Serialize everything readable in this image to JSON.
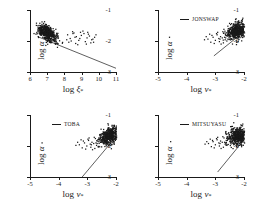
{
  "figure": {
    "width": 257,
    "height": 211,
    "background": "#ffffff",
    "ink": "#1a1a1a"
  },
  "chart_data": [
    {
      "type": "scatter",
      "panel": "top-left",
      "title": "",
      "legend_label": "",
      "legend_position": "none",
      "xlabel": "log ξ",
      "xlabel_sub": "*",
      "ylabel": "log α",
      "xlim": [
        6,
        11
      ],
      "ylim": [
        -3,
        -1
      ],
      "xticks": [
        6,
        7,
        8,
        9,
        10,
        11
      ],
      "xticklabels": [
        "6",
        "7",
        "8",
        "9",
        "10",
        "11"
      ],
      "yticks": [
        -1,
        -2,
        -3
      ],
      "yticklabels": [
        "-1",
        "-2",
        "-3"
      ],
      "grid": false,
      "marker": "dot",
      "line": {
        "x": [
          6.45,
          11.0
        ],
        "y": [
          -1.86,
          -2.88
        ]
      },
      "cluster": {
        "cx": 6.95,
        "cy": -1.72,
        "sx": 0.3,
        "sy": 0.115,
        "rotation_deg": -18,
        "n": 520
      },
      "sparse": {
        "x": [
          8.15,
          8.3,
          8.52,
          8.66,
          8.8,
          8.95,
          9.1,
          9.28,
          9.42,
          9.55,
          9.72,
          8.22,
          8.44,
          8.62,
          8.9,
          9.18,
          9.36,
          9.62,
          8.36,
          8.74,
          9.04,
          9.5,
          8.1,
          8.58,
          9.24,
          9.8,
          8.46,
          8.86,
          9.32,
          9.66
        ],
        "y": [
          -1.78,
          -1.9,
          -1.72,
          -1.84,
          -1.96,
          -1.8,
          -1.74,
          -1.88,
          -1.82,
          -1.94,
          -1.86,
          -2.02,
          -1.68,
          -2.06,
          -1.7,
          -2.0,
          -1.76,
          -1.92,
          -1.98,
          -2.1,
          -1.66,
          -2.04,
          -1.94,
          -1.86,
          -2.08,
          -1.78,
          -1.74,
          -1.9,
          -1.7,
          -2.02
        ]
      }
    },
    {
      "type": "scatter",
      "panel": "top-right",
      "title": "",
      "legend_label": "JONSWAP",
      "legend_position": "upper left",
      "xlabel": "log ν",
      "xlabel_sub": "*",
      "ylabel": "log α",
      "xlim": [
        -5,
        -2
      ],
      "ylim": [
        -3,
        -1
      ],
      "xticks": [
        -5,
        -4,
        -3,
        -2
      ],
      "xticklabels": [
        "-5",
        "-4",
        "-3",
        "-2"
      ],
      "yticks": [
        -1,
        -2,
        -3
      ],
      "yticklabels": [
        "-1",
        "-2",
        "-3"
      ],
      "grid": false,
      "marker": "dot",
      "line": {
        "x": [
          -3.05,
          -2.0
        ],
        "y": [
          -2.48,
          -1.7
        ]
      },
      "cluster": {
        "cx": -2.26,
        "cy": -1.66,
        "sx": 0.175,
        "sy": 0.125,
        "rotation_deg": 30,
        "n": 520
      },
      "sparse": {
        "x": [
          -3.28,
          -3.1,
          -2.96,
          -2.84,
          -2.72,
          -2.64,
          -2.56,
          -3.18,
          -3.02,
          -2.9,
          -2.78,
          -2.68,
          -2.6,
          -3.34,
          -3.06,
          -2.88,
          -2.74,
          -2.62,
          -3.22,
          -2.94,
          -2.82,
          -2.7,
          -3.14,
          -2.98,
          -2.86,
          -2.66,
          -4.62,
          -3.4,
          -2.76,
          -2.58
        ],
        "y": [
          -1.92,
          -1.86,
          -1.78,
          -1.84,
          -1.72,
          -1.8,
          -1.74,
          -2.02,
          -1.96,
          -1.9,
          -1.88,
          -1.94,
          -1.82,
          -1.84,
          -2.06,
          -2.0,
          -2.04,
          -1.98,
          -1.76,
          -1.7,
          -2.08,
          -1.86,
          -1.8,
          -1.74,
          -1.92,
          -1.88,
          -1.86,
          -1.94,
          -1.68,
          -1.76
        ]
      }
    },
    {
      "type": "scatter",
      "panel": "bottom-left",
      "title": "",
      "legend_label": "TOBA",
      "legend_position": "upper left",
      "xlabel": "log ν",
      "xlabel_sub": "*",
      "ylabel": "log α",
      "xlim": [
        -5,
        -2
      ],
      "ylim": [
        -3,
        -1
      ],
      "xticks": [
        -5,
        -4,
        -3,
        -2
      ],
      "xticklabels": [
        "-5",
        "-4",
        "-3",
        "-2"
      ],
      "yticks": [
        -1,
        -2,
        -3
      ],
      "yticklabels": [
        "-1",
        "-2",
        "-3"
      ],
      "grid": false,
      "marker": "dot",
      "line": {
        "x": [
          -3.18,
          -2.0
        ],
        "y": [
          -3.0,
          -1.7
        ]
      },
      "cluster": {
        "cx": -2.24,
        "cy": -1.64,
        "sx": 0.185,
        "sy": 0.12,
        "rotation_deg": 28,
        "n": 520
      },
      "sparse": {
        "x": [
          -3.3,
          -3.12,
          -2.98,
          -2.86,
          -2.74,
          -2.66,
          -2.58,
          -3.2,
          -3.04,
          -2.92,
          -2.8,
          -2.7,
          -2.62,
          -3.36,
          -3.08,
          -2.9,
          -2.76,
          -2.64,
          -3.24,
          -2.96,
          -2.84,
          -2.72,
          -3.16,
          -3.0,
          -2.88,
          -2.68,
          -4.6,
          -3.42,
          -2.78,
          -2.6
        ],
        "y": [
          -1.94,
          -1.88,
          -1.8,
          -1.86,
          -1.74,
          -1.82,
          -1.76,
          -2.04,
          -1.98,
          -1.92,
          -1.9,
          -1.96,
          -1.84,
          -1.86,
          -2.08,
          -2.02,
          -2.06,
          -2.0,
          -1.78,
          -1.72,
          -2.1,
          -1.88,
          -1.82,
          -1.76,
          -1.94,
          -1.9,
          -1.88,
          -1.96,
          -1.7,
          -1.78
        ]
      }
    },
    {
      "type": "scatter",
      "panel": "bottom-right",
      "title": "",
      "legend_label": "MITSUYASU",
      "legend_position": "upper left",
      "xlabel": "log ν",
      "xlabel_sub": "*",
      "ylabel": "log α",
      "xlim": [
        -5,
        -2
      ],
      "ylim": [
        -3,
        -1
      ],
      "xticks": [
        -5,
        -4,
        -3,
        -2
      ],
      "xticklabels": [
        "-5",
        "-4",
        "-3",
        "-2"
      ],
      "yticks": [
        -1,
        -2,
        -3
      ],
      "yticklabels": [
        "-1",
        "-2",
        "-3"
      ],
      "grid": false,
      "marker": "dot",
      "line": {
        "x": [
          -2.92,
          -2.0
        ],
        "y": [
          -2.84,
          -1.8
        ]
      },
      "cluster": {
        "cx": -2.22,
        "cy": -1.66,
        "sx": 0.175,
        "sy": 0.13,
        "rotation_deg": 26,
        "n": 520
      },
      "sparse": {
        "x": [
          -3.26,
          -3.1,
          -2.96,
          -2.84,
          -2.72,
          -2.64,
          -2.56,
          -3.16,
          -3.02,
          -2.9,
          -2.78,
          -2.68,
          -2.6,
          -3.32,
          -3.06,
          -2.88,
          -2.74,
          -2.62,
          -3.2,
          -2.94,
          -2.82,
          -2.7,
          -3.12,
          -2.98,
          -2.86,
          -2.66,
          -4.58,
          -3.38,
          -2.76,
          -2.58
        ],
        "y": [
          -1.9,
          -1.84,
          -1.78,
          -1.82,
          -1.72,
          -1.8,
          -1.74,
          -2.0,
          -1.94,
          -1.88,
          -1.86,
          -1.92,
          -1.8,
          -1.84,
          -2.04,
          -1.98,
          -2.02,
          -1.96,
          -1.76,
          -1.7,
          -2.06,
          -1.86,
          -1.8,
          -1.74,
          -1.9,
          -1.88,
          -1.84,
          -1.92,
          -1.68,
          -1.76
        ]
      }
    }
  ]
}
